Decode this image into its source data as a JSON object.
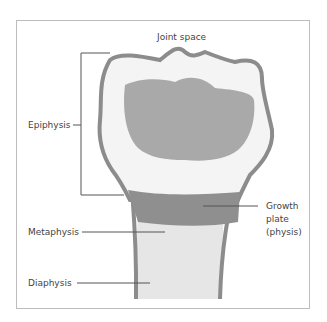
{
  "diagram": {
    "labels": {
      "joint_space": "Joint space",
      "epiphysis": "Epiphysis",
      "growth_plate_1": "Growth",
      "growth_plate_2": "plate",
      "growth_plate_3": "(physis)",
      "metaphysis": "Metaphysis",
      "diaphysis": "Diaphysis"
    },
    "colors": {
      "outline": "#8c8c8c",
      "epiphysis_core": "#a9a9a9",
      "epiphysis_fill": "#f4f4f4",
      "growth_plate": "#8f8f8f",
      "shaft": "#e6e6e6",
      "leader": "#555555",
      "frame": "#bdbdbd"
    }
  }
}
